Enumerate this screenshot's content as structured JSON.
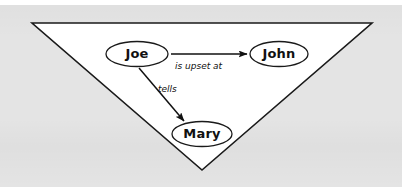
{
  "figure": {
    "kind": "node-link-diagram",
    "caption_text": "",
    "background_color": "#e4e4e4",
    "page_color": "#ffffff",
    "shape": {
      "name": "inverted-triangle",
      "fill_color": "#ffffff",
      "stroke_color": "#1a1a1a",
      "points": "32,23 372,23 202,170"
    },
    "nodes": [
      {
        "id": "joe",
        "label": "Joe",
        "cx": 137,
        "cy": 54,
        "rx": 31,
        "ry": 12.5,
        "fill_color": "#ffffff",
        "stroke_color": "#1a1a1a",
        "font_size": 13
      },
      {
        "id": "john",
        "label": "John",
        "cx": 279,
        "cy": 54,
        "rx": 29,
        "ry": 12.5,
        "fill_color": "#ffffff",
        "stroke_color": "#1a1a1a",
        "font_size": 13
      },
      {
        "id": "mary",
        "label": "Mary",
        "cx": 202,
        "cy": 134,
        "rx": 30,
        "ry": 12.5,
        "fill_color": "#ffffff",
        "stroke_color": "#1a1a1a",
        "font_size": 13
      }
    ],
    "edges": [
      {
        "id": "joe-john",
        "from": "joe",
        "to": "john",
        "label": "is upset at",
        "label_x": 175,
        "label_y": 61,
        "font_size": 9,
        "x1": 171,
        "y1": 54,
        "x2": 247,
        "y2": 54,
        "stroke_color": "#111111"
      },
      {
        "id": "joe-mary",
        "from": "joe",
        "to": "mary",
        "label": "tells",
        "label_x": 158,
        "label_y": 84,
        "font_size": 9,
        "x1": 139,
        "y1": 68,
        "x2": 184,
        "y2": 121,
        "stroke_color": "#111111"
      }
    ]
  }
}
